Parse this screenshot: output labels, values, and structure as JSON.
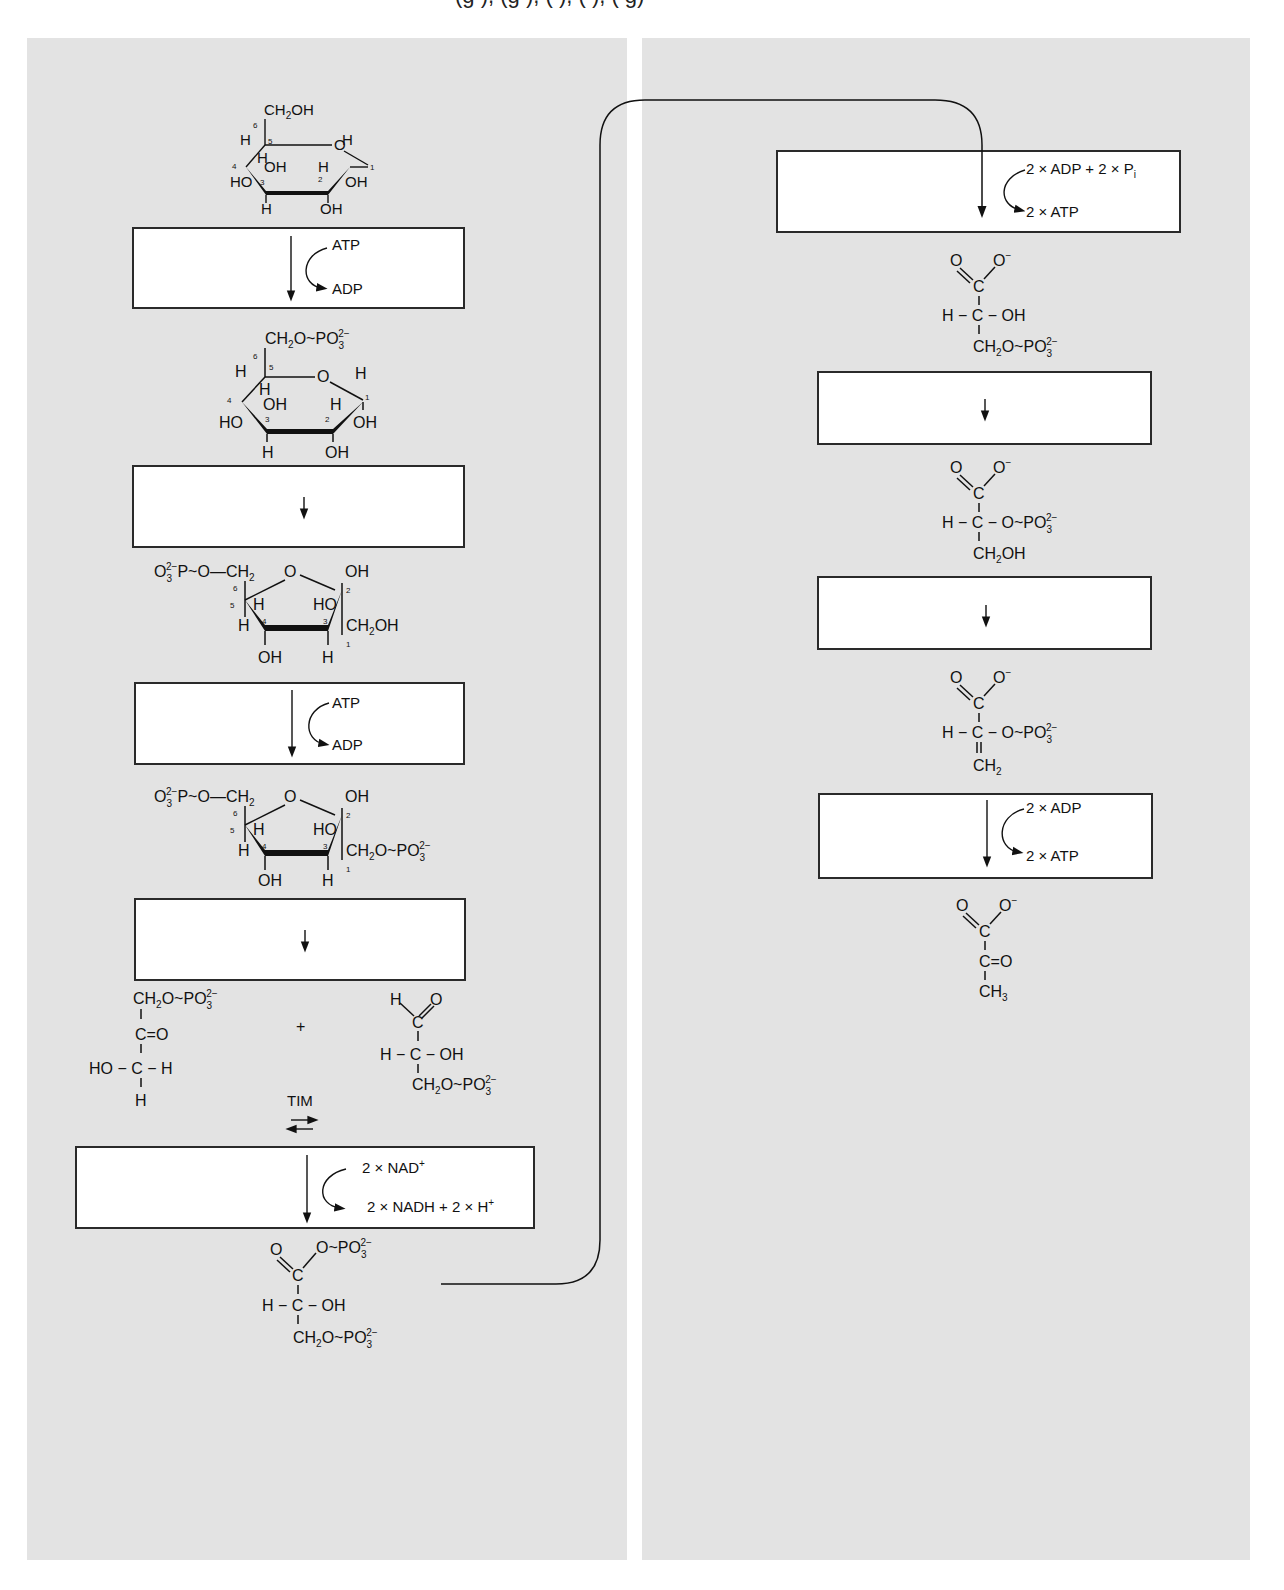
{
  "header_fragment": "(g  ),          (g  ),          (   ),          (  ),          (   g)",
  "colors": {
    "panel_background": "#e3e3e3",
    "box_fill": "#ffffff",
    "box_border": "#2a2a2a",
    "ink": "#111111"
  },
  "left_panel": {
    "molecules": [
      {
        "id": "glucose",
        "name": "alpha-D-glucose (pyranose)",
        "labels": [
          "CH2OH",
          "O",
          "H",
          "HO",
          "OH",
          "OH",
          "OH",
          "H",
          "H",
          "H",
          "H"
        ],
        "carbon_numbers": [
          "1",
          "2",
          "3",
          "4",
          "5",
          "6"
        ]
      },
      {
        "id": "glucose-6-phosphate",
        "name": "glucose 6-phosphate",
        "top_group": "CH2O~PO3 2-"
      },
      {
        "id": "fructose-6-phosphate",
        "name": "fructose 6-phosphate",
        "left_group": "O3 2- -P~O—CH2",
        "right_group": "CH2OH"
      },
      {
        "id": "fructose-1-6-bisphosphate",
        "name": "fructose 1,6-bisphosphate",
        "left_group": "O3 2- -P~O—CH2",
        "right_group": "CH2O~PO3 2-"
      },
      {
        "id": "dihydroxyacetone-phosphate",
        "name": "dihydroxyacetone phosphate",
        "lines": [
          "CH2O~PO3 2-",
          "C=O",
          "HO-C-H",
          "H"
        ]
      },
      {
        "id": "glyceraldehyde-3-phosphate",
        "name": "glyceraldehyde 3-phosphate",
        "lines": [
          "H C=O",
          "H-C-OH",
          "CH2O~PO3 2-"
        ]
      },
      {
        "id": "1-3-bisphosphoglycerate",
        "name": "1,3-bisphosphoglycerate",
        "lines": [
          "O=C-O~PO3 2-",
          "H-C-OH",
          "CH2O~PO3 2-"
        ]
      }
    ],
    "steps": [
      {
        "id": "step-1",
        "arrow": "down",
        "in": "ATP",
        "out": "ADP"
      },
      {
        "id": "step-2",
        "arrow": "down"
      },
      {
        "id": "step-3",
        "arrow": "down",
        "in": "ATP",
        "out": "ADP"
      },
      {
        "id": "step-4",
        "arrow": "down"
      },
      {
        "id": "step-6",
        "arrow": "down",
        "in": "2 × NAD",
        "in_sup": "+",
        "out": "2 × NADH + 2 × H",
        "out_sup": "+"
      }
    ],
    "plus": "+",
    "tim_label": "TIM",
    "equilibrium_symbol": "⇄"
  },
  "right_panel": {
    "molecules": [
      {
        "id": "3-phosphoglycerate",
        "name": "3-phosphoglycerate",
        "lines": [
          "O=C-O-",
          "H-C-OH",
          "CH2O~PO3 2-"
        ]
      },
      {
        "id": "2-phosphoglycerate",
        "name": "2-phosphoglycerate",
        "lines": [
          "O=C-O-",
          "H-C-O~PO3 2-",
          "CH2OH"
        ]
      },
      {
        "id": "phosphoenolpyruvate",
        "name": "phosphoenolpyruvate",
        "lines": [
          "O=C-O-",
          "H-C-O~PO3 2-",
          "=CH2"
        ]
      },
      {
        "id": "pyruvate",
        "name": "pyruvate",
        "lines": [
          "O=C-O-",
          "C=O",
          "CH3"
        ]
      }
    ],
    "steps": [
      {
        "id": "step-7",
        "arrow": "down",
        "in": "2 × ADP + 2 × P",
        "in_sub": "i",
        "out": "2 × ATP"
      },
      {
        "id": "step-8",
        "arrow": "down"
      },
      {
        "id": "step-9",
        "arrow": "down"
      },
      {
        "id": "step-10",
        "arrow": "down",
        "in": "2 × ADP",
        "out": "2 × ATP"
      }
    ]
  },
  "text": {
    "ch2oh": "CH",
    "sub2": "2",
    "sub3": "3",
    "oh": "OH",
    "ho": "HO",
    "h": "H",
    "o": "O",
    "c": "C",
    "p_link": "O~PO",
    "charge2": "2−",
    "minus": "−",
    "ring_o": "O",
    "o3p": "O",
    "p_o_ch2": "−P~O—CH",
    "n1": "1",
    "n2": "2",
    "n3": "3",
    "n4": "4",
    "n5": "5",
    "n6": "6",
    "c_eq_o": "C=O",
    "ho_c_h": "HO − C − H",
    "h_c_oh": "H − C − OH",
    "h_c_o": "H − C − O~PO",
    "ch3": "CH"
  }
}
